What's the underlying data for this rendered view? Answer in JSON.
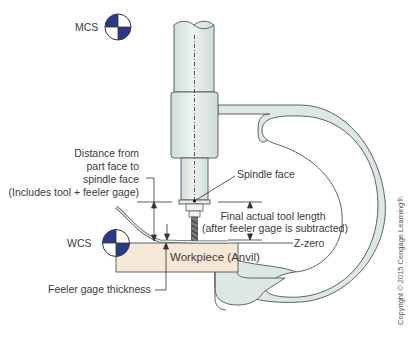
{
  "figure": {
    "type": "tool-length-setting-diagram",
    "colors": {
      "frame_fill": "#dde7e4",
      "frame_stroke": "#5a6663",
      "workpiece_fill": "#f6e7d6",
      "symbol_blue": "#2b3a86",
      "text": "#3a3a3a"
    }
  },
  "labels": {
    "mcs": "MCS",
    "wcs": "WCS",
    "distance_line1": "Distance from",
    "distance_line2": "part face to",
    "distance_line3": "spindle face",
    "distance_line4": "(Includes tool + feeler gage)",
    "spindle_face": "Spindle face",
    "final_line1": "Final actual tool length",
    "final_line2": "(after feeler gage is subtracted)",
    "z_zero": "Z-zero",
    "workpiece": "Workpiece (Anvil)",
    "feeler_gage": "Feeler gage thickness",
    "copyright": "Copyright © 2015 Cengage Learning®."
  },
  "icons": {
    "mcs_symbol": "coordinate-system-icon",
    "wcs_symbol": "coordinate-system-icon"
  }
}
